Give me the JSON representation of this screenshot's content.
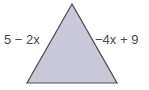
{
  "diagram": {
    "shape": "triangle",
    "fill": "#c9c8d9",
    "stroke": "#4a4a4a",
    "vertices": [
      [
        72,
        4
      ],
      [
        27,
        83
      ],
      [
        117,
        83
      ]
    ],
    "labels": {
      "left_side": "5 − 2x",
      "right_side": "−4x + 9"
    }
  }
}
